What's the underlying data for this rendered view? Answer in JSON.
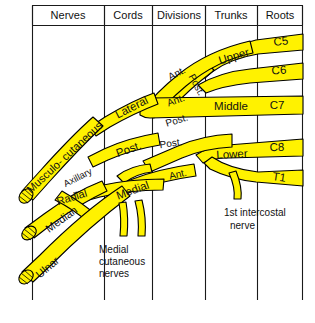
{
  "figure": {
    "caption": ""
  },
  "colors": {
    "band_fill": "#FFF200",
    "outline": "#000000",
    "grid": "#1a1a1a",
    "text": "#111111",
    "background": "#ffffff"
  },
  "header": {
    "columns": [
      {
        "label": "Nerves"
      },
      {
        "label": "Cords"
      },
      {
        "label": "Divisions"
      },
      {
        "label": "Trunks"
      },
      {
        "label": "Roots"
      }
    ]
  },
  "roots": [
    {
      "label": "C5"
    },
    {
      "label": "C6"
    },
    {
      "label": "C7"
    },
    {
      "label": "C8"
    },
    {
      "label": "T1"
    }
  ],
  "trunks": [
    {
      "label": "Upper"
    },
    {
      "label": "Middle"
    },
    {
      "label": "Lower"
    }
  ],
  "divisions": [
    {
      "label": "Ant."
    },
    {
      "label": "Post."
    },
    {
      "label": "Ant."
    },
    {
      "label": "Post."
    },
    {
      "label": "Post."
    },
    {
      "label": "Ant."
    }
  ],
  "cords": [
    {
      "label": "Lateral"
    },
    {
      "label": "Post."
    },
    {
      "label": "Medial"
    }
  ],
  "nerves": [
    {
      "label": "Musculo- cutaneous"
    },
    {
      "label": "Axillary"
    },
    {
      "label": "Radial"
    },
    {
      "label": "Median"
    },
    {
      "label": "Ulnar"
    }
  ],
  "annotations": [
    {
      "lines": [
        "Medial",
        "cutaneous",
        "nerves"
      ]
    },
    {
      "lines": [
        "1st intercostal",
        "nerve"
      ]
    }
  ]
}
